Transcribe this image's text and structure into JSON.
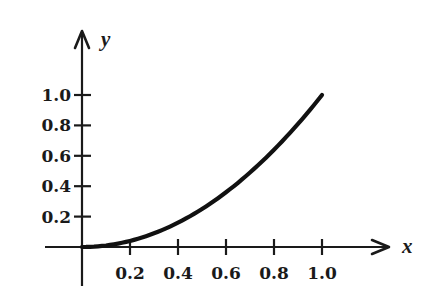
{
  "chart_data": {
    "type": "line",
    "title": "",
    "xlabel": "x",
    "ylabel": "y",
    "xlim": [
      0,
      1.0
    ],
    "ylim": [
      0,
      1.0
    ],
    "grid": false,
    "legend": null,
    "x_ticks": [
      "0.2",
      "0.4",
      "0.6",
      "0.8",
      "1.0"
    ],
    "y_ticks": [
      "0.2",
      "0.4",
      "0.6",
      "0.8",
      "1.0"
    ],
    "function": "y = x^2",
    "series": [
      {
        "name": "curve",
        "x": [
          0,
          0.1,
          0.2,
          0.3,
          0.4,
          0.5,
          0.6,
          0.7,
          0.8,
          0.9,
          1.0
        ],
        "values": [
          0,
          0.01,
          0.04,
          0.09,
          0.16,
          0.25,
          0.36,
          0.49,
          0.64,
          0.81,
          1.0
        ]
      }
    ],
    "colors": {
      "ink": "#1a1a1a",
      "background": "#ffffff"
    }
  }
}
